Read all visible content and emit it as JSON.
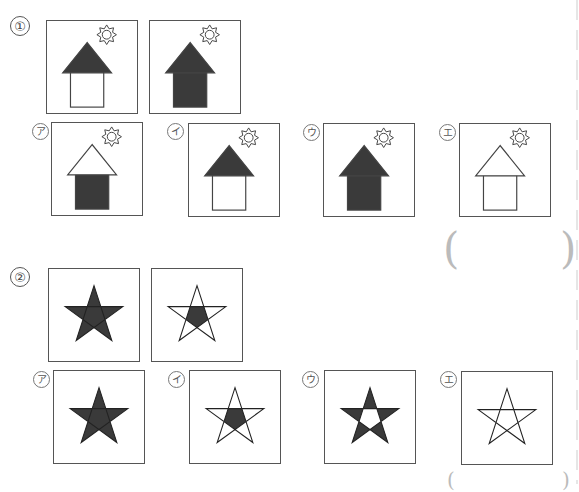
{
  "colors": {
    "fill": "#3a3a3a",
    "stroke": "#444444",
    "paren": "#bbbbbb"
  },
  "question1": {
    "number": "①",
    "examples": [
      {
        "roof": "filled",
        "wall": "empty",
        "sun": true
      },
      {
        "roof": "filled",
        "wall": "filled",
        "sun": true
      }
    ],
    "choices": [
      {
        "label": "ア",
        "roof": "empty",
        "wall": "filled",
        "sun": true
      },
      {
        "label": "イ",
        "roof": "filled",
        "wall": "empty",
        "sun": true
      },
      {
        "label": "ウ",
        "roof": "filled",
        "wall": "filled",
        "sun": true
      },
      {
        "label": "エ",
        "roof": "empty",
        "wall": "empty",
        "sun": true
      }
    ],
    "answer_parens": {
      "open": "(",
      "close": ")"
    }
  },
  "question2": {
    "number": "②",
    "examples": [
      {
        "points": "filled",
        "center": "filled"
      },
      {
        "points": "empty",
        "center": "filled"
      }
    ],
    "choices": [
      {
        "label": "ア",
        "points": "filled",
        "center": "filled"
      },
      {
        "label": "イ",
        "points": "empty",
        "center": "filled"
      },
      {
        "label": "ウ",
        "points": "filled",
        "center": "empty"
      },
      {
        "label": "エ",
        "points": "empty",
        "center": "empty"
      }
    ],
    "answer_parens": {
      "open": "(",
      "close": ")"
    }
  }
}
